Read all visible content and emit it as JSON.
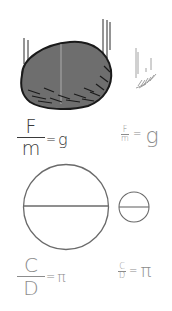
{
  "figure": {
    "top_section": {
      "large_object": "heavy-rock",
      "small_object": "feather",
      "formula_large": {
        "numerator": "F",
        "denominator": "m",
        "equals": "=",
        "result": "g"
      },
      "formula_small": {
        "numerator": "F",
        "denominator": "m",
        "equals": "=",
        "result": "g"
      }
    },
    "bottom_section": {
      "large_object": "large-circle-with-diameter",
      "small_object": "small-circle-with-diameter",
      "formula_large": {
        "numerator": "C",
        "denominator": "D",
        "equals": "=",
        "result": "π"
      },
      "formula_small": {
        "numerator": "C",
        "denominator": "D",
        "equals": "=",
        "result": "π"
      }
    },
    "colors": {
      "rock_fill": "#6e6e6e",
      "rock_outline": "#1a1a1a",
      "line_dark": "#2a2a2a",
      "line_light": "#8a8a8a",
      "text_dark": "#3a3a3a",
      "text_light": "#8c8c8c",
      "background": "#ffffff"
    }
  }
}
